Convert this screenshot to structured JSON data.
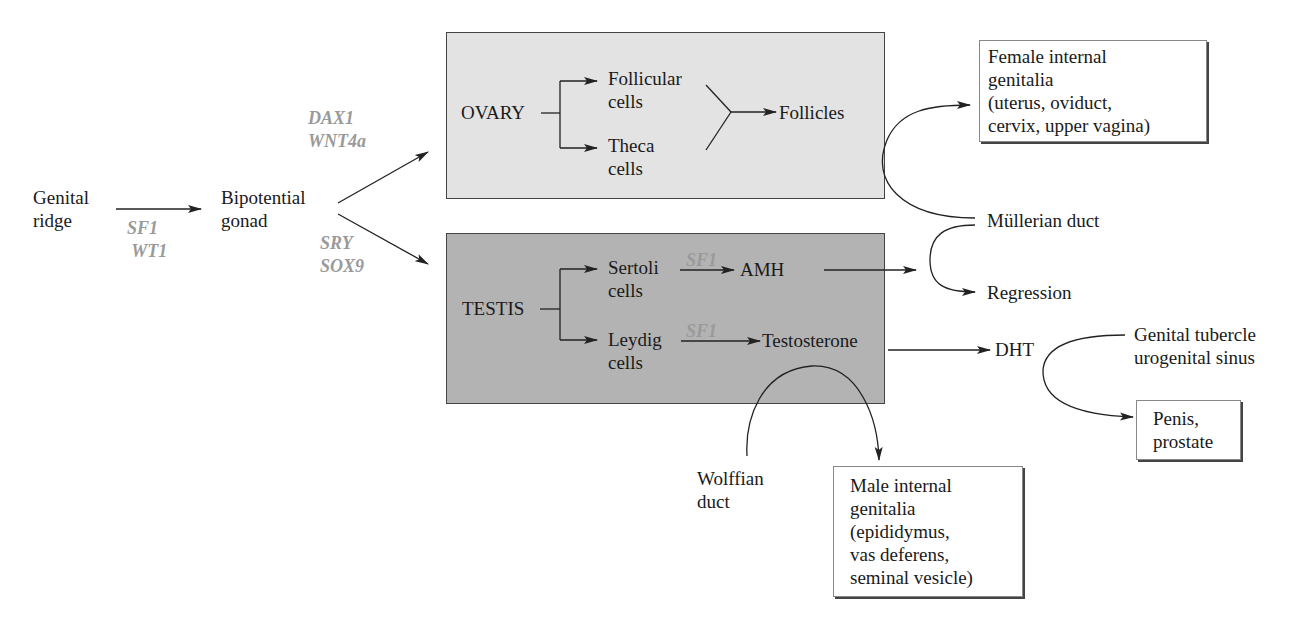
{
  "diagram": {
    "type": "flowchart",
    "nodes": {
      "genital_ridge": "Genital\nridge",
      "bipotential_gonad": "Bipotential\ngonad",
      "ovary": "OVARY",
      "follicular_cells": "Follicular\ncells",
      "theca_cells": "Theca\ncells",
      "follicles": "Follicles",
      "testis": "TESTIS",
      "sertoli_cells": "Sertoli\ncells",
      "leydig_cells": "Leydig\ncells",
      "amh": "AMH",
      "testosterone": "Testosterone",
      "dht": "DHT",
      "mullerian_duct": "Müllerian duct",
      "regression": "Regression",
      "female_internal": "Female internal\ngenitalia\n(uterus, oviduct,\ncervix, upper vagina)",
      "genital_tubercle": "Genital tubercle\nurogenital sinus",
      "penis_prostate": "Penis,\nprostate",
      "wolffian_duct": "Wolffian\nduct",
      "male_internal": "Male internal\ngenitalia\n(epididymus,\nvas deferens,\nseminal vesicle)"
    },
    "genes": {
      "ridge_to_gonad": "SF1\n WT1",
      "to_ovary": "DAX1\nWNT4a",
      "to_testis": "SRY\nSOX9",
      "sertoli_to_amh": "SF1",
      "leydig_to_testosterone": "SF1"
    },
    "colors": {
      "ovary_fill": "#e3e3e3",
      "testis_fill": "#b3b3b3",
      "gene_text": "#9a9a9a",
      "line": "#222222"
    }
  }
}
